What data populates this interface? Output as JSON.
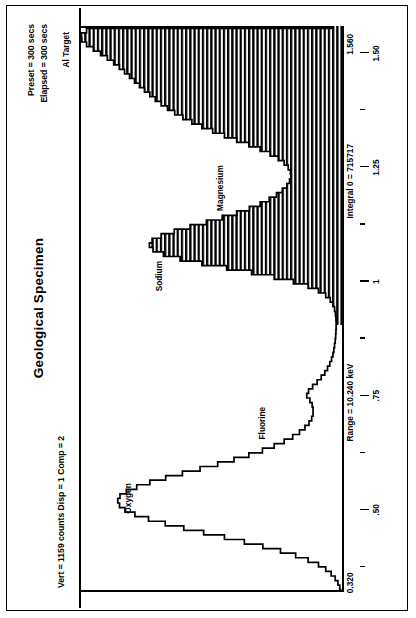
{
  "header": {
    "title": "Geological Specimen",
    "left_status": "Vert = 1159 counts   Disp = 1   Comp = 2",
    "preset": "Preset = 300 secs",
    "elapsed": "Elapsed = 300 secs"
  },
  "footer": {
    "start_energy": "0.320",
    "range": "Range = 10.240 keV",
    "integral": "Integral 0 = 715717",
    "end_energy": "1.560"
  },
  "chart_data": {
    "type": "line",
    "title": "Geological Specimen",
    "xlabel": "",
    "ylabel": "counts",
    "xlim": [
      0.32,
      1.56
    ],
    "ylim": [
      0,
      1159
    ],
    "grid": false,
    "legend": "none",
    "tick_labels": [
      ".50",
      ".75",
      "1",
      "1.25",
      "1.50"
    ],
    "tick_values": [
      0.5,
      0.75,
      1.0,
      1.25,
      1.5
    ],
    "minor_tick_values": [
      0.375,
      0.625,
      0.875,
      1.125,
      1.375
    ],
    "annotations": [
      {
        "label": "Oxygen",
        "x": 0.525,
        "y": 900
      },
      {
        "label": "Fluorine",
        "x": 0.685,
        "y": 420
      },
      {
        "label": "Sodium",
        "x": 1.04,
        "y": 1130
      },
      {
        "label": "Magnesium",
        "x": 1.255,
        "y": 790
      },
      {
        "label": "Al Target",
        "x": 1.515,
        "y": 1145
      }
    ],
    "series": [
      {
        "name": "EDS spectrum",
        "x": [
          0.32,
          0.33,
          0.34,
          0.35,
          0.36,
          0.37,
          0.38,
          0.39,
          0.4,
          0.41,
          0.42,
          0.43,
          0.44,
          0.45,
          0.46,
          0.47,
          0.48,
          0.49,
          0.5,
          0.51,
          0.52,
          0.53,
          0.54,
          0.55,
          0.56,
          0.57,
          0.58,
          0.59,
          0.6,
          0.61,
          0.62,
          0.63,
          0.64,
          0.65,
          0.66,
          0.67,
          0.68,
          0.69,
          0.7,
          0.71,
          0.72,
          0.73,
          0.74,
          0.75,
          0.76,
          0.77,
          0.78,
          0.79,
          0.8,
          0.81,
          0.82,
          0.83,
          0.84,
          0.85,
          0.86,
          0.87,
          0.88,
          0.89,
          0.9,
          0.91,
          0.92,
          0.93,
          0.94,
          0.95,
          0.96,
          0.97,
          0.98,
          0.99,
          1.0,
          1.01,
          1.02,
          1.03,
          1.04,
          1.05,
          1.06,
          1.07,
          1.08,
          1.09,
          1.1,
          1.11,
          1.12,
          1.13,
          1.14,
          1.15,
          1.16,
          1.17,
          1.18,
          1.19,
          1.2,
          1.21,
          1.22,
          1.23,
          1.24,
          1.25,
          1.26,
          1.27,
          1.28,
          1.29,
          1.3,
          1.31,
          1.32,
          1.33,
          1.34,
          1.35,
          1.36,
          1.37,
          1.38,
          1.39,
          1.4,
          1.41,
          1.42,
          1.43,
          1.44,
          1.45,
          1.46,
          1.47,
          1.48,
          1.49,
          1.5,
          1.51,
          1.52,
          1.53,
          1.54,
          1.55,
          1.56
        ],
        "y": [
          6,
          10,
          18,
          30,
          48,
          72,
          104,
          150,
          205,
          272,
          350,
          432,
          520,
          612,
          700,
          782,
          856,
          916,
          960,
          984,
          992,
          982,
          954,
          908,
          850,
          780,
          706,
          628,
          550,
          478,
          412,
          352,
          300,
          256,
          218,
          188,
          164,
          146,
          134,
          128,
          128,
          132,
          142,
          156,
          148,
          130,
          110,
          92,
          76,
          64,
          54,
          46,
          40,
          36,
          33,
          30,
          28,
          27,
          26,
          26,
          27,
          29,
          33,
          40,
          52,
          72,
          104,
          150,
          215,
          300,
          400,
          510,
          620,
          716,
          790,
          836,
          852,
          840,
          800,
          742,
          672,
          600,
          530,
          466,
          410,
          362,
          322,
          290,
          264,
          244,
          232,
          226,
          228,
          238,
          256,
          282,
          318,
          362,
          412,
          466,
          520,
          572,
          620,
          664,
          704,
          740,
          772,
          800,
          826,
          850,
          874,
          896,
          918,
          940,
          962,
          985,
          1010,
          1038,
          1068,
          1100,
          1130,
          1152,
          1158,
          1130,
          40
        ]
      }
    ]
  }
}
